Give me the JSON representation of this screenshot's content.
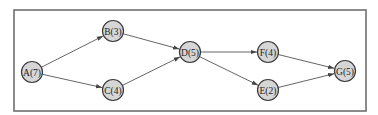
{
  "diagram": {
    "type": "activity-network",
    "nodes": [
      {
        "id": "A",
        "label": "A(7)",
        "duration": 7,
        "x": 32,
        "y": 72
      },
      {
        "id": "B",
        "label": "B(3)",
        "duration": 3,
        "x": 113,
        "y": 31
      },
      {
        "id": "C",
        "label": "C(4)",
        "duration": 4,
        "x": 113,
        "y": 90
      },
      {
        "id": "D",
        "label": "D(5)",
        "duration": 5,
        "x": 190,
        "y": 52
      },
      {
        "id": "F",
        "label": "F(4)",
        "duration": 4,
        "x": 268,
        "y": 52
      },
      {
        "id": "E",
        "label": "E(2)",
        "duration": 2,
        "x": 268,
        "y": 90
      },
      {
        "id": "G",
        "label": "G(5)",
        "duration": 5,
        "x": 345,
        "y": 71
      }
    ],
    "edges": [
      {
        "from": "A",
        "to": "B"
      },
      {
        "from": "A",
        "to": "C"
      },
      {
        "from": "B",
        "to": "D"
      },
      {
        "from": "C",
        "to": "D"
      },
      {
        "from": "D",
        "to": "F"
      },
      {
        "from": "D",
        "to": "E"
      },
      {
        "from": "F",
        "to": "G"
      },
      {
        "from": "E",
        "to": "G"
      }
    ]
  },
  "colors": {
    "node_fill": "#d6d6d6",
    "node_stroke": "#3a3a3a",
    "edge": "#555555",
    "frame": "#6f6f6f"
  }
}
